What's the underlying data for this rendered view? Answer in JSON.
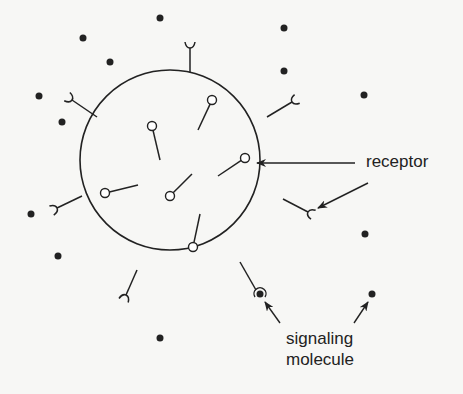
{
  "diagram": {
    "type": "cell-signaling",
    "colors": {
      "ink": "#222222",
      "background": "#f7f7f5"
    },
    "cell": {
      "cx": 170,
      "cy": 160,
      "r": 90
    },
    "internal_receptors": [
      {
        "x1": 198,
        "y1": 130,
        "x2": 212,
        "y2": 100
      },
      {
        "x1": 160,
        "y1": 160,
        "x2": 152,
        "y2": 126
      },
      {
        "x1": 218,
        "y1": 176,
        "x2": 245,
        "y2": 158
      },
      {
        "x1": 192,
        "y1": 174,
        "x2": 170,
        "y2": 196
      },
      {
        "x1": 138,
        "y1": 185,
        "x2": 105,
        "y2": 193
      },
      {
        "x1": 200,
        "y1": 214,
        "x2": 193,
        "y2": 247
      }
    ],
    "surface_receptors": [
      {
        "x1": 190,
        "y1": 72,
        "x2": 190,
        "y2": 48,
        "angle": 0
      },
      {
        "x1": 97,
        "y1": 117,
        "x2": 72,
        "y2": 100,
        "angle": -55
      },
      {
        "x1": 267,
        "y1": 117,
        "x2": 292,
        "y2": 102,
        "angle": 60
      },
      {
        "x1": 82,
        "y1": 196,
        "x2": 57,
        "y2": 208,
        "angle": -115
      },
      {
        "x1": 283,
        "y1": 199,
        "x2": 308,
        "y2": 212,
        "angle": 120
      },
      {
        "x1": 137,
        "y1": 270,
        "x2": 126,
        "y2": 295,
        "angle": 200
      }
    ],
    "bound_receptor": {
      "x1": 240,
      "y1": 262,
      "x2": 256,
      "y2": 290,
      "molecule": {
        "cx": 260,
        "cy": 294
      }
    },
    "signaling_molecules": [
      {
        "cx": 160,
        "cy": 18
      },
      {
        "cx": 83,
        "cy": 38
      },
      {
        "cx": 110,
        "cy": 62
      },
      {
        "cx": 284,
        "cy": 28
      },
      {
        "cx": 284,
        "cy": 71
      },
      {
        "cx": 364,
        "cy": 95
      },
      {
        "cx": 39,
        "cy": 96
      },
      {
        "cx": 62,
        "cy": 122
      },
      {
        "cx": 31,
        "cy": 214
      },
      {
        "cx": 58,
        "cy": 256
      },
      {
        "cx": 365,
        "cy": 234
      },
      {
        "cx": 372,
        "cy": 294
      },
      {
        "cx": 160,
        "cy": 338
      }
    ],
    "arrows": [
      {
        "name": "arrow-receptor-internal",
        "x1": 355,
        "y1": 163,
        "x2": 257,
        "y2": 163
      },
      {
        "name": "arrow-receptor-surface",
        "x1": 368,
        "y1": 183,
        "x2": 318,
        "y2": 208
      },
      {
        "name": "arrow-signaling-bound",
        "x1": 280,
        "y1": 323,
        "x2": 265,
        "y2": 302
      },
      {
        "name": "arrow-signaling-free",
        "x1": 354,
        "y1": 323,
        "x2": 368,
        "y2": 302
      }
    ]
  },
  "labels": {
    "receptor": "receptor",
    "signaling_line1": "signaling",
    "signaling_line2": "molecule"
  }
}
